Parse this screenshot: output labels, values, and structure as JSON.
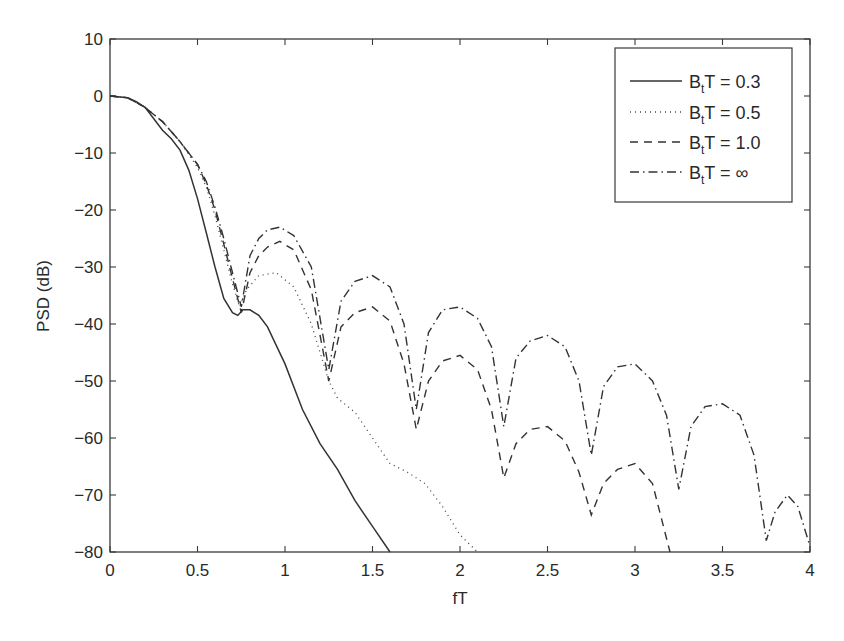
{
  "chart_data": {
    "type": "line",
    "title": "",
    "xlabel": "fT",
    "ylabel": "PSD (dB)",
    "xlim": [
      0,
      4
    ],
    "ylim": [
      -80,
      10
    ],
    "xticks": [
      0,
      0.5,
      1,
      1.5,
      2,
      2.5,
      3,
      3.5,
      4
    ],
    "xtick_labels": [
      "0",
      "0.5",
      "1",
      "1.5",
      "2",
      "2.5",
      "3",
      "3.5",
      "4"
    ],
    "yticks": [
      10,
      0,
      -10,
      -20,
      -30,
      -40,
      -50,
      -60,
      -70,
      -80
    ],
    "ytick_labels": [
      "10",
      "0",
      "−10",
      "−20",
      "−30",
      "−40",
      "−50",
      "−60",
      "−70",
      "−80"
    ],
    "grid": false,
    "legend_position": "upper right",
    "series": [
      {
        "name": "B_tT = 0.3",
        "label_main": "B",
        "label_sub": "t",
        "label_rest": "T = 0.3",
        "style": "solid",
        "x": [
          0,
          0.1,
          0.15,
          0.2,
          0.25,
          0.3,
          0.35,
          0.4,
          0.45,
          0.5,
          0.55,
          0.6,
          0.65,
          0.7,
          0.73,
          0.76,
          0.8,
          0.85,
          0.9,
          1.0,
          1.1,
          1.2,
          1.3,
          1.4,
          1.5,
          1.6
        ],
        "y": [
          0,
          -0.3,
          -1,
          -2,
          -4,
          -6,
          -7.5,
          -9.5,
          -13,
          -18,
          -24,
          -30,
          -35.5,
          -38,
          -38.5,
          -37.5,
          -37.5,
          -38.5,
          -40.5,
          -47,
          -55,
          -61,
          -65.5,
          -71,
          -75.5,
          -80
        ]
      },
      {
        "name": "B_tT = 0.5",
        "label_main": "B",
        "label_sub": "t",
        "label_rest": "T = 0.5",
        "style": "dotted",
        "x": [
          0,
          0.1,
          0.2,
          0.3,
          0.4,
          0.5,
          0.55,
          0.6,
          0.65,
          0.7,
          0.74,
          0.78,
          0.85,
          0.95,
          1.05,
          1.15,
          1.25,
          1.3,
          1.4,
          1.5,
          1.6,
          1.7,
          1.8,
          1.9,
          2.0,
          2.1
        ],
        "y": [
          0,
          -0.3,
          -2,
          -4.5,
          -8,
          -12.5,
          -16,
          -21,
          -27,
          -33,
          -37,
          -34,
          -31.5,
          -31,
          -33.5,
          -40,
          -50,
          -53,
          -55.5,
          -60,
          -64.5,
          -66,
          -68,
          -72,
          -77,
          -80
        ]
      },
      {
        "name": "B_tT = 1.0",
        "label_main": "B",
        "label_sub": "t",
        "label_rest": "T = 1.0",
        "style": "dashed",
        "x": [
          0,
          0.1,
          0.2,
          0.3,
          0.4,
          0.5,
          0.55,
          0.6,
          0.65,
          0.7,
          0.75,
          0.8,
          0.85,
          0.9,
          0.97,
          1.05,
          1.15,
          1.25,
          1.32,
          1.4,
          1.5,
          1.6,
          1.68,
          1.75,
          1.82,
          1.9,
          2.0,
          2.1,
          2.18,
          2.25,
          2.32,
          2.4,
          2.5,
          2.6,
          2.68,
          2.75,
          2.82,
          2.9,
          3.0,
          3.1,
          3.2
        ],
        "y": [
          0,
          -0.3,
          -2,
          -4.5,
          -8,
          -12,
          -15.5,
          -20,
          -26,
          -32,
          -38,
          -31,
          -28,
          -26.5,
          -25.5,
          -27,
          -34,
          -50,
          -40.5,
          -38,
          -37,
          -39.5,
          -47,
          -58.5,
          -50,
          -46.5,
          -45.5,
          -48,
          -55,
          -67,
          -61,
          -58.5,
          -58,
          -60.5,
          -66,
          -73.5,
          -68,
          -65.5,
          -64.5,
          -68,
          -80
        ]
      },
      {
        "name": "B_tT = ∞",
        "label_main": "B",
        "label_sub": "t",
        "label_rest": "T = ∞",
        "style": "dashdot",
        "x": [
          0,
          0.1,
          0.2,
          0.3,
          0.4,
          0.5,
          0.55,
          0.6,
          0.65,
          0.7,
          0.75,
          0.8,
          0.85,
          0.9,
          0.97,
          1.05,
          1.15,
          1.25,
          1.32,
          1.4,
          1.5,
          1.6,
          1.68,
          1.75,
          1.82,
          1.9,
          2.0,
          2.1,
          2.18,
          2.25,
          2.32,
          2.4,
          2.5,
          2.6,
          2.68,
          2.75,
          2.82,
          2.9,
          3.0,
          3.1,
          3.18,
          3.25,
          3.32,
          3.4,
          3.5,
          3.6,
          3.68,
          3.75,
          3.8,
          3.87,
          3.93,
          4.0
        ],
        "y": [
          0,
          -0.3,
          -2,
          -4.5,
          -8,
          -12,
          -15,
          -19.5,
          -25,
          -31,
          -37,
          -28,
          -25,
          -23.5,
          -23,
          -24.5,
          -30,
          -48,
          -36,
          -32.5,
          -31.5,
          -33.5,
          -40,
          -55,
          -41.5,
          -37.5,
          -37,
          -39,
          -44,
          -58,
          -46,
          -43,
          -42,
          -44,
          -50,
          -63,
          -51,
          -47.5,
          -47,
          -50,
          -56,
          -69,
          -58,
          -54.5,
          -54,
          -56,
          -63,
          -78,
          -73,
          -70,
          -72,
          -79
        ]
      }
    ]
  },
  "legend": {
    "items": [
      {
        "main": "B",
        "sub": "t",
        "rest": "T = 0.3"
      },
      {
        "main": "B",
        "sub": "t",
        "rest": "T = 0.5"
      },
      {
        "main": "B",
        "sub": "t",
        "rest": "T = 1.0"
      },
      {
        "main": "B",
        "sub": "t",
        "rest": "T = ∞"
      }
    ]
  },
  "axes": {
    "xlabel": "fT",
    "ylabel": "PSD (dB)"
  }
}
